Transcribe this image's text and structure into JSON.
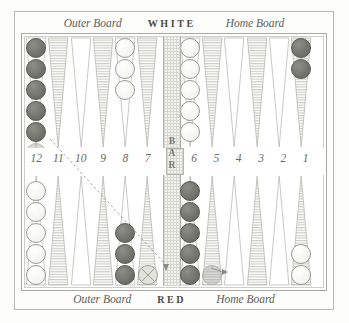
{
  "app": {
    "title": "Backgammon Board"
  },
  "labels": {
    "top": {
      "outer_board": "Outer Board",
      "player": "WHITE",
      "home_board": "Home Board"
    },
    "bottom": {
      "outer_board": "Outer Board",
      "player": "RED",
      "home_board": "Home Board"
    },
    "bar": "BAR"
  },
  "colors": {
    "red_checker": "#6e6e68",
    "white_checker": "#f4f4f0",
    "point_hatch": "#cdcdc7",
    "point_plain": "#ffffff",
    "frame": "#a9a9a4",
    "text": "#5d5d58",
    "bar_fill": "#f2f2ee"
  },
  "point_numbers": [
    "12",
    "11",
    "10",
    "9",
    "8",
    "7",
    "6",
    "5",
    "4",
    "3",
    "2",
    "1"
  ],
  "board": {
    "top_points": [
      {
        "number": "12",
        "style": "plain",
        "checkers": 5,
        "color": "red",
        "ghost": 1
      },
      {
        "number": "11",
        "style": "hatched",
        "checkers": 0,
        "color": "none",
        "ghost": 0
      },
      {
        "number": "10",
        "style": "plain",
        "checkers": 0,
        "color": "none",
        "ghost": 0
      },
      {
        "number": "9",
        "style": "hatched",
        "checkers": 0,
        "color": "none",
        "ghost": 0
      },
      {
        "number": "8",
        "style": "plain",
        "checkers": 3,
        "color": "white",
        "ghost": 0
      },
      {
        "number": "7",
        "style": "hatched",
        "checkers": 0,
        "color": "none",
        "ghost": 0
      },
      {
        "number": "6",
        "style": "plain",
        "checkers": 5,
        "color": "white",
        "ghost": 0
      },
      {
        "number": "5",
        "style": "hatched",
        "checkers": 0,
        "color": "none",
        "ghost": 0
      },
      {
        "number": "4",
        "style": "plain",
        "checkers": 0,
        "color": "none",
        "ghost": 0
      },
      {
        "number": "3",
        "style": "hatched",
        "checkers": 0,
        "color": "none",
        "ghost": 0
      },
      {
        "number": "2",
        "style": "plain",
        "checkers": 0,
        "color": "none",
        "ghost": 0
      },
      {
        "number": "1",
        "style": "hatched",
        "checkers": 2,
        "color": "red",
        "ghost": 0
      }
    ],
    "bottom_points": [
      {
        "number": "12",
        "style": "plain",
        "checkers": 5,
        "color": "white",
        "ghost": 0
      },
      {
        "number": "11",
        "style": "hatched",
        "checkers": 0,
        "color": "none",
        "ghost": 0
      },
      {
        "number": "10",
        "style": "plain",
        "checkers": 0,
        "color": "none",
        "ghost": 0
      },
      {
        "number": "9",
        "style": "hatched",
        "checkers": 0,
        "color": "none",
        "ghost": 0
      },
      {
        "number": "8",
        "style": "plain",
        "checkers": 3,
        "color": "red",
        "ghost": 0
      },
      {
        "number": "7",
        "style": "hatched",
        "checkers": 0,
        "color": "none",
        "ghost": 0,
        "drop_target": true
      },
      {
        "number": "6",
        "style": "plain",
        "checkers": 5,
        "color": "red",
        "ghost": 0
      },
      {
        "number": "5",
        "style": "hatched",
        "checkers": 0,
        "color": "none",
        "ghost": 1
      },
      {
        "number": "4",
        "style": "plain",
        "checkers": 0,
        "color": "none",
        "ghost": 0
      },
      {
        "number": "3",
        "style": "hatched",
        "checkers": 0,
        "color": "none",
        "ghost": 0
      },
      {
        "number": "2",
        "style": "plain",
        "checkers": 0,
        "color": "none",
        "ghost": 0
      },
      {
        "number": "1",
        "style": "hatched",
        "checkers": 2,
        "color": "white",
        "ghost": 0
      }
    ]
  },
  "drag": {
    "from_x": 50,
    "from_y": 139,
    "to_x": 166,
    "to_y": 273,
    "arrow_x": 166,
    "arrow_y": 272
  },
  "arrow2": {
    "from_x": 211,
    "from_y": 268,
    "to_x": 228,
    "to_y": 272
  }
}
